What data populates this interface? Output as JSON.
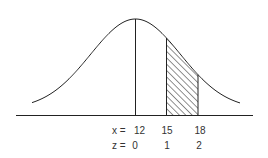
{
  "diagram": {
    "type": "normal-distribution",
    "mean_x": 12,
    "colors": {
      "stroke": "#222222",
      "text": "#333333",
      "background": "#ffffff"
    },
    "shaded_region": {
      "from_x": 15,
      "to_x": 18,
      "pattern": "diagonal-hatch"
    },
    "labels": {
      "x_row_prefix": "x =",
      "z_row_prefix": "z =",
      "x_values": [
        "12",
        "15",
        "18"
      ],
      "z_values": [
        "0",
        "1",
        "2"
      ]
    }
  }
}
